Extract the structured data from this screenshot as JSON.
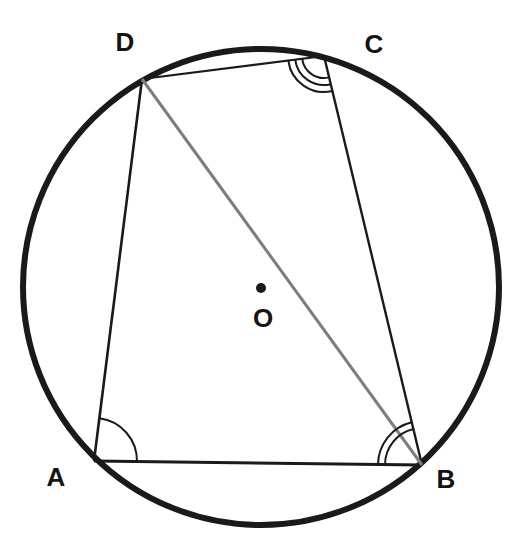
{
  "figure": {
    "type": "circle-with-inscribed-quadrilateral",
    "background": "#ffffff",
    "ink": "#1a1a1a",
    "canvas": {
      "width": 524,
      "height": 559
    },
    "circle": {
      "cx": 261,
      "cy": 287,
      "r": 238,
      "stroke_width": 6
    },
    "center_point": {
      "label": "O",
      "x": 261,
      "y": 288,
      "dot_radius": 5,
      "label_pos": {
        "x": 263,
        "y": 318
      }
    },
    "vertices": [
      {
        "id": "A",
        "label": "A",
        "x": 94,
        "y": 461,
        "label_pos": {
          "x": 56,
          "y": 477
        }
      },
      {
        "id": "B",
        "label": "B",
        "x": 422,
        "y": 465,
        "label_pos": {
          "x": 446,
          "y": 479
        }
      },
      {
        "id": "C",
        "label": "C",
        "x": 324,
        "y": 56,
        "label_pos": {
          "x": 374,
          "y": 44
        }
      },
      {
        "id": "D",
        "label": "D",
        "x": 142,
        "y": 79,
        "label_pos": {
          "x": 125,
          "y": 42
        }
      }
    ],
    "edges": [
      {
        "from": "A",
        "to": "B",
        "width": 3.0
      },
      {
        "from": "B",
        "to": "C",
        "width": 2.4
      },
      {
        "from": "C",
        "to": "D",
        "width": 2.2
      },
      {
        "from": "D",
        "to": "A",
        "width": 2.6
      }
    ],
    "diagonals": [
      {
        "from": "D",
        "to": "B",
        "color": "#7d7d7d",
        "width": 3
      }
    ],
    "angle_marks": [
      {
        "vertex": "A",
        "from": "B",
        "to": "D",
        "arc_count": 1,
        "radii": [
          43
        ],
        "width": 2
      },
      {
        "vertex": "B",
        "from": "A",
        "to": "C",
        "arc_count": 2,
        "radii": [
          37,
          44
        ],
        "width": 2
      },
      {
        "vertex": "C",
        "from": "B",
        "to": "D",
        "arc_count": 3,
        "radii": [
          22,
          29,
          36
        ],
        "width": 2
      }
    ]
  }
}
